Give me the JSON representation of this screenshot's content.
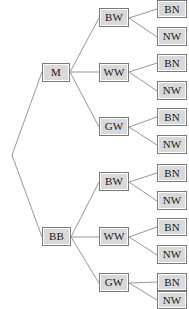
{
  "diagram": {
    "type": "tree",
    "canvas": {
      "width": 189,
      "height": 309
    },
    "style": {
      "node_fill": "#d9d9d9",
      "node_border": "#7a7a7a",
      "edge_color": "#8a8a8a",
      "background": "#ffffff",
      "text_color": "#1a1a1a"
    },
    "root": {
      "name": "tree-root-vertex",
      "x": 12,
      "y": 155
    },
    "nodes": [
      {
        "id": "m",
        "label": "M",
        "gen": 1,
        "x": 42,
        "y": 63,
        "w": 28,
        "h": 19
      },
      {
        "id": "bb",
        "label": "BB",
        "gen": 1,
        "x": 42,
        "y": 227,
        "w": 29,
        "h": 19
      },
      {
        "id": "m-bw",
        "label": "BW",
        "gen": 2,
        "x": 99,
        "y": 8,
        "w": 30,
        "h": 19
      },
      {
        "id": "m-ww",
        "label": "WW",
        "gen": 2,
        "x": 99,
        "y": 63,
        "w": 30,
        "h": 19
      },
      {
        "id": "m-gw",
        "label": "GW",
        "gen": 2,
        "x": 99,
        "y": 117,
        "w": 30,
        "h": 19
      },
      {
        "id": "bb-bw",
        "label": "BW",
        "gen": 2,
        "x": 99,
        "y": 172,
        "w": 30,
        "h": 19
      },
      {
        "id": "bb-ww",
        "label": "WW",
        "gen": 2,
        "x": 99,
        "y": 227,
        "w": 30,
        "h": 19
      },
      {
        "id": "bb-gw",
        "label": "GW",
        "gen": 2,
        "x": 99,
        "y": 273,
        "w": 30,
        "h": 19
      },
      {
        "id": "m-bw-bn",
        "label": "BN",
        "gen": 3,
        "x": 157,
        "y": 0,
        "w": 30,
        "h": 18
      },
      {
        "id": "m-bw-nw",
        "label": "NW",
        "gen": 3,
        "x": 157,
        "y": 27,
        "w": 30,
        "h": 19
      },
      {
        "id": "m-ww-bn",
        "label": "BN",
        "gen": 3,
        "x": 157,
        "y": 54,
        "w": 30,
        "h": 18
      },
      {
        "id": "m-ww-nw",
        "label": "NW",
        "gen": 3,
        "x": 157,
        "y": 81,
        "w": 30,
        "h": 19
      },
      {
        "id": "m-gw-bn",
        "label": "BN",
        "gen": 3,
        "x": 157,
        "y": 108,
        "w": 30,
        "h": 18
      },
      {
        "id": "m-gw-nw",
        "label": "NW",
        "gen": 3,
        "x": 157,
        "y": 135,
        "w": 30,
        "h": 19
      },
      {
        "id": "bb-bw-bn",
        "label": "BN",
        "gen": 3,
        "x": 157,
        "y": 164,
        "w": 30,
        "h": 18
      },
      {
        "id": "bb-bw-nw",
        "label": "NW",
        "gen": 3,
        "x": 157,
        "y": 191,
        "w": 30,
        "h": 19
      },
      {
        "id": "bb-ww-bn",
        "label": "BN",
        "gen": 3,
        "x": 157,
        "y": 218,
        "w": 30,
        "h": 18
      },
      {
        "id": "bb-ww-nw",
        "label": "NW",
        "gen": 3,
        "x": 157,
        "y": 245,
        "w": 30,
        "h": 19
      },
      {
        "id": "bb-gw-bn",
        "label": "BN",
        "gen": 3,
        "x": 157,
        "y": 273,
        "w": 30,
        "h": 18
      },
      {
        "id": "bb-gw-nw",
        "label": "NW",
        "gen": 3,
        "x": 157,
        "y": 291,
        "w": 30,
        "h": 18
      }
    ],
    "edges": [
      {
        "from": "root",
        "to": "m",
        "x1": 12,
        "y1": 155,
        "x2": 42,
        "y2": 72
      },
      {
        "from": "root",
        "to": "bb",
        "x1": 12,
        "y1": 155,
        "x2": 42,
        "y2": 237
      },
      {
        "from": "m",
        "to": "m-bw",
        "x1": 70,
        "y1": 72,
        "x2": 99,
        "y2": 18
      },
      {
        "from": "m",
        "to": "m-ww",
        "x1": 70,
        "y1": 72,
        "x2": 99,
        "y2": 72
      },
      {
        "from": "m",
        "to": "m-gw",
        "x1": 70,
        "y1": 72,
        "x2": 99,
        "y2": 127
      },
      {
        "from": "bb",
        "to": "bb-bw",
        "x1": 71,
        "y1": 237,
        "x2": 99,
        "y2": 182
      },
      {
        "from": "bb",
        "to": "bb-ww",
        "x1": 71,
        "y1": 237,
        "x2": 99,
        "y2": 237
      },
      {
        "from": "bb",
        "to": "bb-gw",
        "x1": 71,
        "y1": 237,
        "x2": 99,
        "y2": 283
      },
      {
        "from": "m-bw",
        "to": "m-bw-bn",
        "x1": 129,
        "y1": 18,
        "x2": 157,
        "y2": 9
      },
      {
        "from": "m-bw",
        "to": "m-bw-nw",
        "x1": 129,
        "y1": 18,
        "x2": 157,
        "y2": 37
      },
      {
        "from": "m-ww",
        "to": "m-ww-bn",
        "x1": 129,
        "y1": 72,
        "x2": 157,
        "y2": 63
      },
      {
        "from": "m-ww",
        "to": "m-ww-nw",
        "x1": 129,
        "y1": 72,
        "x2": 157,
        "y2": 91
      },
      {
        "from": "m-gw",
        "to": "m-gw-bn",
        "x1": 129,
        "y1": 127,
        "x2": 157,
        "y2": 117
      },
      {
        "from": "m-gw",
        "to": "m-gw-nw",
        "x1": 129,
        "y1": 127,
        "x2": 157,
        "y2": 145
      },
      {
        "from": "bb-bw",
        "to": "bb-bw-bn",
        "x1": 129,
        "y1": 182,
        "x2": 157,
        "y2": 173
      },
      {
        "from": "bb-bw",
        "to": "bb-bw-nw",
        "x1": 129,
        "y1": 182,
        "x2": 157,
        "y2": 201
      },
      {
        "from": "bb-ww",
        "to": "bb-ww-bn",
        "x1": 129,
        "y1": 237,
        "x2": 157,
        "y2": 227
      },
      {
        "from": "bb-ww",
        "to": "bb-ww-nw",
        "x1": 129,
        "y1": 237,
        "x2": 157,
        "y2": 255
      },
      {
        "from": "bb-gw",
        "to": "bb-gw-bn",
        "x1": 129,
        "y1": 283,
        "x2": 157,
        "y2": 282
      },
      {
        "from": "bb-gw",
        "to": "bb-gw-nw",
        "x1": 129,
        "y1": 283,
        "x2": 157,
        "y2": 300
      }
    ]
  }
}
